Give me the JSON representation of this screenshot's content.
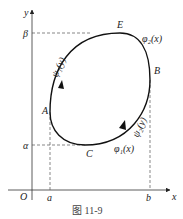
{
  "figure": {
    "axes": {
      "x_label": "x",
      "y_label": "y",
      "origin_label": "O"
    },
    "ticks": {
      "a": "a",
      "b": "b",
      "alpha": "α",
      "beta": "β"
    },
    "points": {
      "A": "A",
      "B": "B",
      "C": "C",
      "E": "E"
    },
    "curve_labels": {
      "phi1x": "φ₁(x)",
      "phi2x": "φ₂(x)",
      "psi1y": "ψ₁(y)",
      "psi2y": "ψ₂(y)"
    },
    "caption": "图   11-9"
  }
}
